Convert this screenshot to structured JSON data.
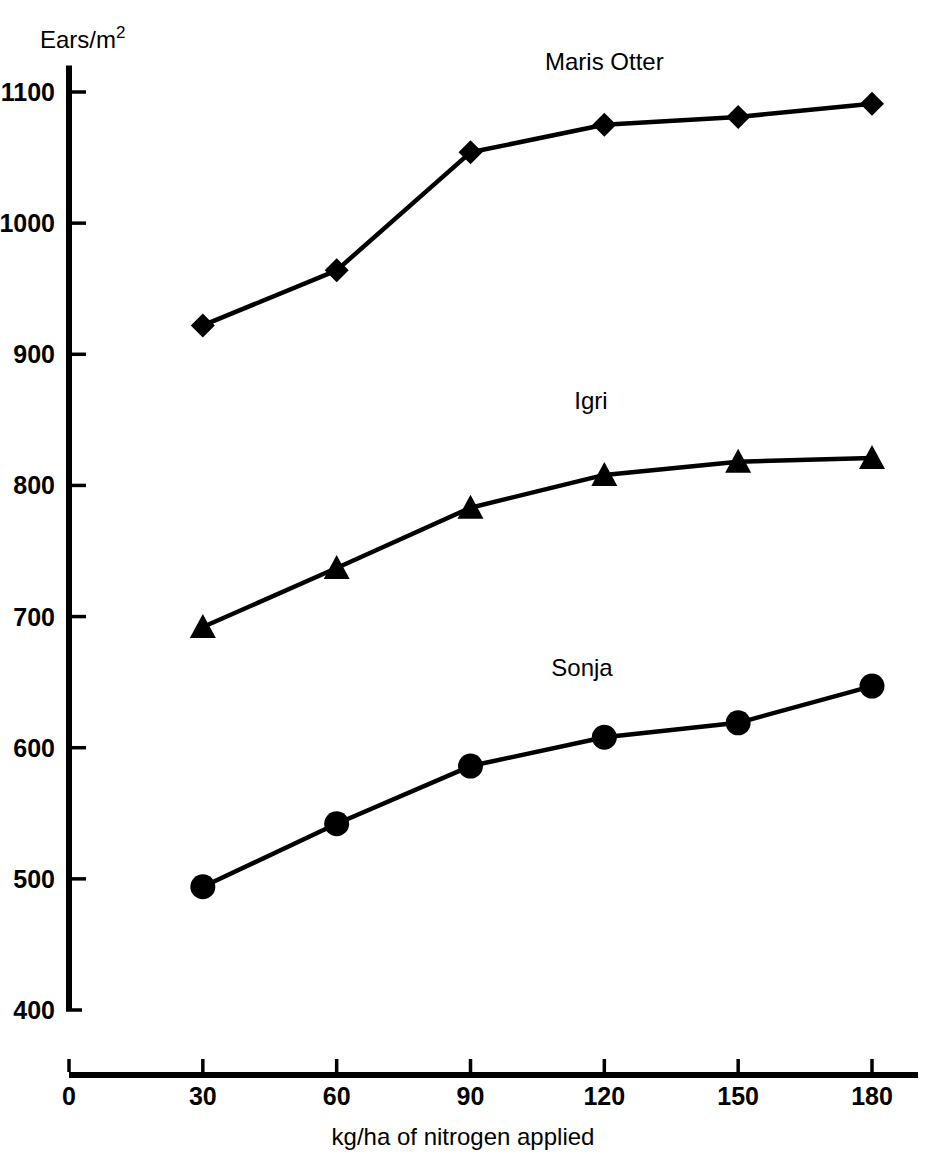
{
  "chart_data": {
    "type": "line",
    "title": "",
    "xlabel": "kg/ha of nitrogen applied",
    "ylabel": "Ears/m",
    "ylabel_superscript": "2",
    "x": [
      30,
      60,
      90,
      120,
      150,
      180
    ],
    "xlim": [
      0,
      190
    ],
    "ylim": [
      400,
      1120
    ],
    "xticks": [
      "0",
      "30",
      "60",
      "90",
      "120",
      "150",
      "180"
    ],
    "xtick_values": [
      0,
      30,
      60,
      90,
      120,
      150,
      180
    ],
    "yticks": [
      "400",
      "500",
      "600",
      "700",
      "800",
      "900",
      "1000",
      "1100"
    ],
    "ytick_values": [
      400,
      500,
      600,
      700,
      800,
      900,
      1000,
      1100
    ],
    "grid": false,
    "legend": "inline-labels",
    "series": [
      {
        "name": "Maris Otter",
        "marker": "diamond",
        "label_x": 120,
        "label_y": 1117,
        "values": [
          922,
          964,
          1054,
          1075,
          1081,
          1091
        ]
      },
      {
        "name": "Igri",
        "marker": "triangle",
        "label_x": 117,
        "label_y": 858,
        "values": [
          692,
          737,
          783,
          808,
          818,
          821
        ]
      },
      {
        "name": "Sonja",
        "marker": "circle",
        "label_x": 115,
        "label_y": 655,
        "values": [
          494,
          542,
          586,
          608,
          619,
          647
        ]
      }
    ]
  },
  "colors": {
    "ink": "#000000",
    "background": "#ffffff"
  }
}
